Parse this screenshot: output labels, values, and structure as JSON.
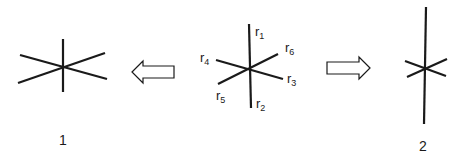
{
  "diagram": {
    "center_figure": {
      "rays": [
        {
          "name": "r",
          "sub": "1"
        },
        {
          "name": "r",
          "sub": "2"
        },
        {
          "name": "r",
          "sub": "3"
        },
        {
          "name": "r",
          "sub": "4"
        },
        {
          "name": "r",
          "sub": "5"
        },
        {
          "name": "r",
          "sub": "6"
        }
      ]
    },
    "left_figure": {
      "label": "1"
    },
    "right_figure": {
      "label": "2"
    },
    "arrows": [
      "left-arrow",
      "right-arrow"
    ],
    "colors": {
      "line": "#1a1a1a",
      "background": "#ffffff"
    }
  }
}
